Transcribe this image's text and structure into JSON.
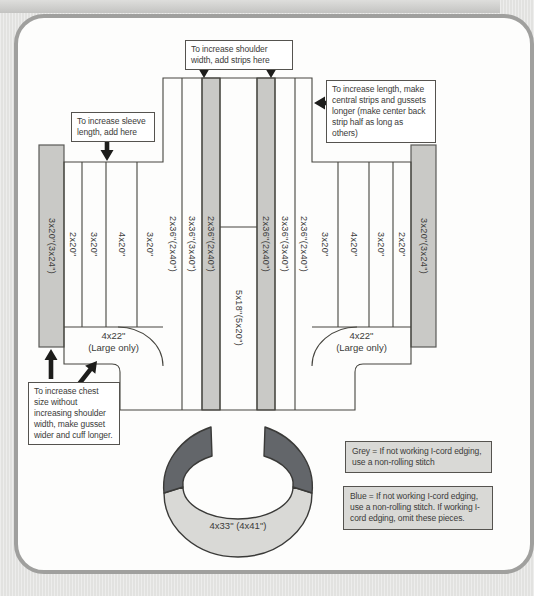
{
  "callouts": {
    "shoulder_width": "To increase shoulder width, add strips here",
    "sleeve_length": "To increase sleeve length, add here",
    "length": "To increase length, make central strips and gussets longer (make center back strip half as long as others)",
    "chest_size": "To increase chest size without increasing shoulder width, make gusset wider and cuff longer."
  },
  "pieces": {
    "left_cuff": "3x20\"(3x24\")",
    "right_cuff": "3x20\"(3x24\")",
    "left_sleeve": [
      "2x20\"",
      "3x20\"",
      "4x20\"",
      "3x20\""
    ],
    "center": [
      "2x36\"(2x40\")",
      "3x36\"(3x40\")",
      "2x36\"(2x40\")",
      "5x18\"(5x20\")",
      "2x36\"(2x40\")",
      "3x36\"(3x40\")",
      "2x36\"(2x40\")"
    ],
    "right_sleeve": [
      "3x20\"",
      "4x20\"",
      "3x20\"",
      "2x20\""
    ],
    "left_gusset": {
      "size": "4x22\"",
      "note": "(Large only)"
    },
    "right_gusset": {
      "size": "4x22\"",
      "note": "(Large only)"
    },
    "collar": "4x33\" (4x41\")"
  },
  "legend": [
    {
      "text": "Grey = If not working I-cord edging, use a non-rolling stitch"
    },
    {
      "text": "Blue = If not working I-cord edging, use a non-rolling stitch. If working I-cord edging, omit these pieces."
    }
  ],
  "colors": {
    "grey_piece": "#c9c9c6",
    "blue_piece": "#63666a",
    "outline": "#46453f"
  }
}
